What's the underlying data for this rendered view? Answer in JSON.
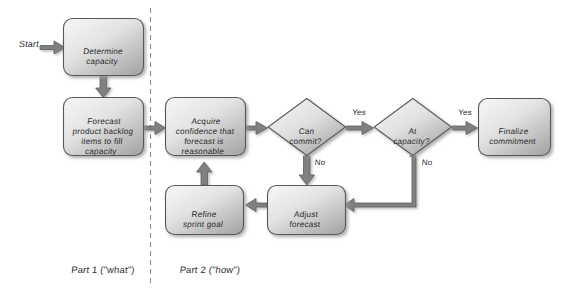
{
  "diagram": {
    "background_color": "#ffffff",
    "node_fill_light": "#f2f2f2",
    "node_fill_dark": "#a8a8a8",
    "node_border_color": "#595959",
    "arrow_color": "#808080",
    "arrow_border_color": "#595959",
    "text_color": "#2b2b2b",
    "divider_color": "#8c8c8c"
  },
  "start": {
    "label": "Start"
  },
  "nodes": {
    "determine_capacity": {
      "label": "Determine\ncapacity",
      "shape": "rounded-rect"
    },
    "forecast_backlog": {
      "label": "Forecast\nproduct backlog\nitems to fill\ncapacity",
      "shape": "rounded-rect"
    },
    "acquire_confidence": {
      "label": "Acquire\nconfidence that\nforecast is\nreasonable",
      "shape": "rounded-rect"
    },
    "can_commit": {
      "label": "Can\ncommit?",
      "shape": "diamond"
    },
    "at_capacity": {
      "label": "At\ncapacity?",
      "shape": "diamond"
    },
    "finalize_commitment": {
      "label": "Finalize\ncommitment",
      "shape": "rounded-rect"
    },
    "adjust_forecast": {
      "label": "Adjust\nforecast",
      "shape": "rounded-rect"
    },
    "refine_sprint_goal": {
      "label": "Refine\nsprint goal",
      "shape": "rounded-rect"
    }
  },
  "edge_labels": {
    "can_commit_yes": "Yes",
    "can_commit_no": "No",
    "at_capacity_yes": "Yes",
    "at_capacity_no": "No"
  },
  "sections": {
    "part1": "Part 1 (\"what\")",
    "part2": "Part 2 (\"how\")"
  }
}
